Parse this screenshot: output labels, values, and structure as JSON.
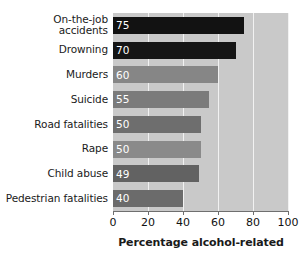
{
  "chart_data": {
    "type": "bar",
    "orientation": "horizontal",
    "title": "",
    "xlabel": "Percentage alcohol-related",
    "ylabel": "",
    "xlim": [
      0,
      100
    ],
    "xticks": [
      "0",
      "20",
      "40",
      "60",
      "80",
      "100"
    ],
    "grid": true,
    "legend": "none",
    "categories": [
      "On-the-job\naccidents",
      "Drowning",
      "Murders",
      "Suicide",
      "Road fatalities",
      "Rape",
      "Child abuse",
      "Pedestrian fatalities"
    ],
    "values": [
      75,
      70,
      60,
      55,
      50,
      50,
      49,
      40
    ],
    "value_labels": [
      "75",
      "70",
      "60",
      "55",
      "50",
      "50",
      "49",
      "40"
    ],
    "bar_colors": [
      "#121212",
      "#151515",
      "#868686",
      "#7b7b7b",
      "#6e6e6e",
      "#8a8a8a",
      "#626262",
      "#6b6b6b"
    ],
    "plot_background": "#c9c9c9",
    "gridline_color": "#f2f2f2",
    "axis_color": "#6f6f6f",
    "value_label_color": "#ffffff",
    "category_label_color": "#1a1a1a"
  }
}
